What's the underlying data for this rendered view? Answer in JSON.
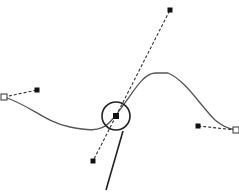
{
  "diagram": {
    "type": "bezier-path-editing",
    "colors": {
      "background": "#ffffff",
      "curve": "#555555",
      "handle_line": "#333333",
      "node_fill": "#111111",
      "anchor_stroke": "#333333",
      "callout": "#222222"
    },
    "curve_path": "M4,97 C30,105 45,122 70,127 C85,130 100,133 110,122 C130,100 140,74 155,73 L168,73 C185,80 200,105 215,120 C222,126 228,129 236,130",
    "anchors": [
      {
        "name": "start-anchor",
        "x": 4,
        "y": 97
      },
      {
        "name": "end-anchor",
        "x": 236,
        "y": 130
      }
    ],
    "nodes": [
      {
        "name": "selected-node",
        "x": 116,
        "y": 116
      }
    ],
    "handles": [
      {
        "name": "start-handle",
        "from": [
          4,
          97
        ],
        "to": [
          37,
          90
        ]
      },
      {
        "name": "node-handle-upper",
        "from": [
          116,
          116
        ],
        "to": [
          170,
          10
        ]
      },
      {
        "name": "node-handle-lower",
        "from": [
          116,
          116
        ],
        "to": [
          93,
          161
        ]
      },
      {
        "name": "end-handle",
        "from": [
          236,
          130
        ],
        "to": [
          198,
          126
        ]
      }
    ],
    "highlight_circle": {
      "cx": 116,
      "cy": 116,
      "r": 14
    },
    "callout_line": {
      "x1": 123,
      "y1": 131,
      "x2": 106,
      "y2": 190
    }
  }
}
